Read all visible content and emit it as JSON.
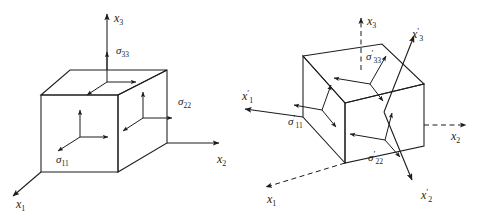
{
  "figure": {
    "title": "",
    "background_color": "#ffffff",
    "line_color": "#1c1c1c",
    "panels": [
      {
        "id": "left-panel",
        "name": "unprimed-stress-element",
        "description": "Rectangular parallelepiped stress element aligned with the x1, x2, x3 axes showing normal stress components",
        "axes": [
          {
            "name": "x3-axis",
            "label": "x",
            "subscript": "3",
            "prime": "",
            "style": "solid",
            "direction": "up"
          },
          {
            "name": "x2-axis",
            "label": "x",
            "subscript": "2",
            "prime": "",
            "style": "solid",
            "direction": "right"
          },
          {
            "name": "x1-axis",
            "label": "x",
            "subscript": "1",
            "prime": "",
            "style": "solid",
            "direction": "down-left"
          }
        ],
        "stresses": [
          {
            "name": "sigma-33",
            "symbol": "σ",
            "subscript": "33",
            "prime": ""
          },
          {
            "name": "sigma-22",
            "symbol": "σ",
            "subscript": "22",
            "prime": ""
          },
          {
            "name": "sigma-11",
            "symbol": "σ",
            "subscript": "11",
            "prime": ""
          }
        ]
      },
      {
        "id": "right-panel",
        "name": "primed-stress-element",
        "description": "Rotated cubic stress element aligned with the primed x1', x2', x3' axes; original x1, x2, x3 axes drawn dashed",
        "axes": [
          {
            "name": "x3-axis-dashed",
            "label": "x",
            "subscript": "3",
            "prime": "",
            "style": "dashed",
            "direction": "up"
          },
          {
            "name": "x3-prime-axis",
            "label": "x",
            "subscript": "3",
            "prime": "′",
            "style": "solid",
            "direction": "up-right"
          },
          {
            "name": "x1-prime-axis",
            "label": "x",
            "subscript": "1",
            "prime": "′",
            "style": "solid",
            "direction": "left"
          },
          {
            "name": "x2-axis-dashed",
            "label": "x",
            "subscript": "2",
            "prime": "",
            "style": "dashed",
            "direction": "right"
          },
          {
            "name": "x1-axis-dashed",
            "label": "x",
            "subscript": "1",
            "prime": "",
            "style": "dashed",
            "direction": "down-left"
          },
          {
            "name": "x2-prime-axis",
            "label": "x",
            "subscript": "2",
            "prime": "′",
            "style": "solid",
            "direction": "down-right"
          }
        ],
        "stresses": [
          {
            "name": "sigma-33-prime",
            "symbol": "σ",
            "subscript": "33",
            "prime": "′"
          },
          {
            "name": "sigma-11-prime",
            "symbol": "σ",
            "subscript": "11",
            "prime": "′"
          },
          {
            "name": "sigma-22-prime",
            "symbol": "σ",
            "subscript": "22",
            "prime": "′"
          }
        ]
      }
    ]
  }
}
